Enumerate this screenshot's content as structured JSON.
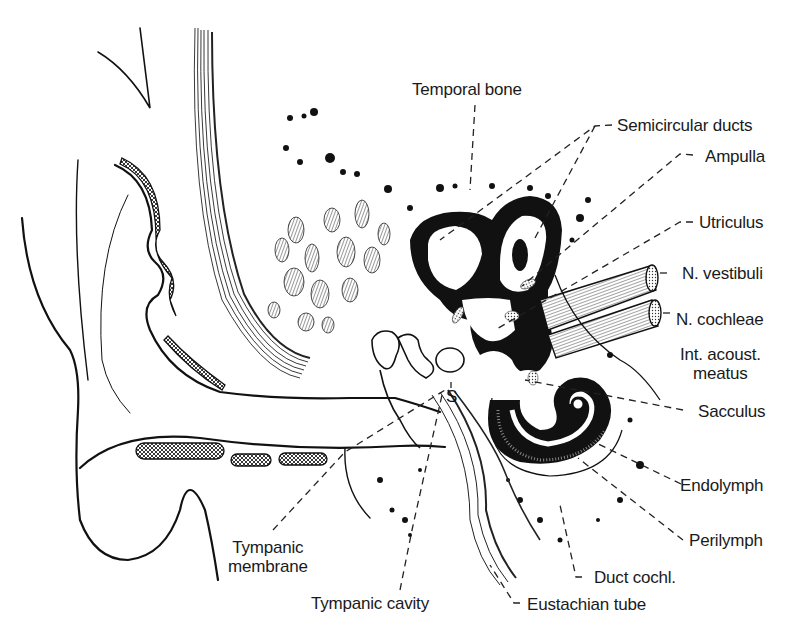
{
  "diagram": {
    "ink_color": "#111111",
    "background_color": "#ffffff",
    "labels": {
      "temporal_bone": "Temporal bone",
      "semicircular_ducts": "Semicircular ducts",
      "ampulla": "Ampulla",
      "utriculus": "Utriculus",
      "n_vestibuli": "N. vestibuli",
      "n_cochleae": "N. cochleae",
      "int_acoust_meatus": "Int. acoust.\nmeatus",
      "sacculus": "Sacculus",
      "endolymph": "Endolymph",
      "perilymph": "Perilymph",
      "duct_cochl": "Duct cochl.",
      "eustachian_tube": "Eustachian tube",
      "tympanic_cavity": "Tympanic cavity",
      "tympanic_membrane": "Tympanic\nmembrane",
      "stapes_marker": "S"
    }
  }
}
